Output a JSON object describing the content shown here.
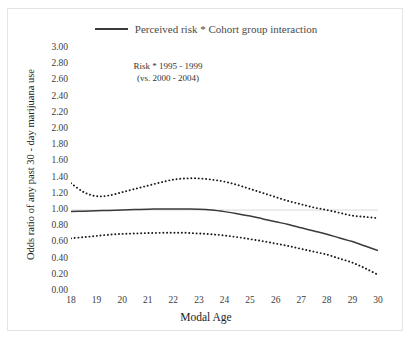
{
  "figure": {
    "cutoff_title": "Marijuana use by cohort group",
    "annotation_line1": "Risk * 1995 - 1999",
    "annotation_line2": "(vs. 2000 - 2004)"
  },
  "legend": {
    "position": "top-center",
    "entries": [
      {
        "label": "Perceived risk * Cohort group interaction",
        "style": "solid",
        "color": "#3a3a3a"
      }
    ]
  },
  "colors": {
    "line": "#3a3a3a",
    "ci_band": "#1a1a1a",
    "gridline": "#d9d9d9",
    "axis_text": "#3c3c3c",
    "frame": "#e3e3e3"
  },
  "chart_data": {
    "type": "line",
    "title": "",
    "subtitle": "Risk * 1995 - 1999 (vs. 2000 - 2004)",
    "xlabel": "Modal Age",
    "ylabel": "Odds ratio of any past 30 - day marijuana use",
    "xlim": [
      18,
      30
    ],
    "ylim": [
      0.0,
      3.0
    ],
    "grid": true,
    "gridlines_y": [
      1.0
    ],
    "legend_position": "top-center",
    "xticks": [
      18,
      19,
      20,
      21,
      22,
      23,
      24,
      25,
      26,
      27,
      28,
      29,
      30
    ],
    "yticks": [
      0.0,
      0.2,
      0.4,
      0.6,
      0.8,
      1.0,
      1.2,
      1.4,
      1.6,
      1.8,
      2.0,
      2.2,
      2.4,
      2.6,
      2.8,
      3.0
    ],
    "ytick_labels": [
      "0.00",
      "0.20",
      "0.40",
      "0.60",
      "0.80",
      "1.00",
      "1.20",
      "1.40",
      "1.60",
      "1.80",
      "2.00",
      "2.20",
      "2.40",
      "2.60",
      "2.80",
      "3.00"
    ],
    "x": [
      18,
      18.5,
      19,
      19.5,
      20,
      20.5,
      21,
      21.5,
      22,
      22.5,
      23,
      23.5,
      24,
      24.5,
      25,
      25.5,
      26,
      26.5,
      27,
      27.5,
      28,
      28.5,
      29,
      29.5,
      30
    ],
    "series": [
      {
        "name": "Perceived risk * Cohort group interaction",
        "style": "solid",
        "values": [
          0.98,
          0.985,
          0.99,
          0.995,
          1.0,
          1.005,
          1.01,
          1.012,
          1.013,
          1.012,
          1.01,
          1.0,
          0.98,
          0.955,
          0.925,
          0.89,
          0.855,
          0.82,
          0.78,
          0.74,
          0.7,
          0.655,
          0.61,
          0.555,
          0.5
        ]
      },
      {
        "name": "Upper 95% confidence limit",
        "style": "dotted",
        "values": [
          1.33,
          1.22,
          1.17,
          1.18,
          1.22,
          1.26,
          1.3,
          1.34,
          1.375,
          1.39,
          1.39,
          1.375,
          1.35,
          1.31,
          1.26,
          1.21,
          1.16,
          1.11,
          1.07,
          1.03,
          1.0,
          0.965,
          0.93,
          0.915,
          0.9
        ]
      },
      {
        "name": "Lower 95% confidence limit",
        "style": "dotted",
        "values": [
          0.65,
          0.665,
          0.68,
          0.695,
          0.705,
          0.71,
          0.715,
          0.718,
          0.72,
          0.718,
          0.71,
          0.7,
          0.685,
          0.665,
          0.64,
          0.615,
          0.585,
          0.555,
          0.52,
          0.485,
          0.45,
          0.4,
          0.35,
          0.28,
          0.2
        ]
      }
    ]
  }
}
